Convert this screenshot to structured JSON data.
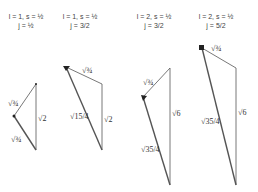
{
  "diagrams": [
    {
      "header_line1": "l = 1, s = ½",
      "header_line2": "j = ½",
      "labels": {
        "vertical": "√2",
        "upper": "√¾",
        "lower": "√¾"
      }
    },
    {
      "header_line1": "l = 1, s = ½",
      "header_line2": "j = 3/2",
      "labels": {
        "vertical": "√2",
        "upper": "√¾",
        "long": "√15/4"
      }
    },
    {
      "header_line1": "l = 2, s = ½",
      "header_line2": "j = 3/2",
      "labels": {
        "vertical": "√6",
        "upper": "√¾",
        "long": "√35/4"
      }
    },
    {
      "header_line1": "l = 2, s = ½",
      "header_line2": "j = 5/2",
      "labels": {
        "vertical": "√6",
        "upper": "√¾",
        "long": "√35/4"
      }
    }
  ]
}
